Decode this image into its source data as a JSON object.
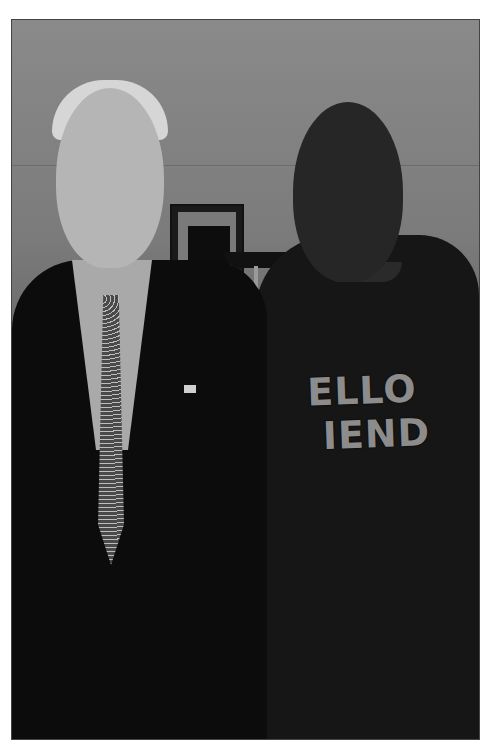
{
  "image": {
    "description": "Black-and-white photograph of two smiling men standing side by side indoors",
    "style": "black and white",
    "border_color": "#ffffff"
  },
  "background": {
    "wall": "plain gray wall",
    "objects": [
      "framed picture",
      "floor lamp"
    ]
  },
  "people": [
    {
      "position": "left",
      "attire": "dark suit, light shirt, dotted tie, flag lapel pin",
      "hair": "light gray"
    },
    {
      "position": "right",
      "attire": "dark sweatshirt with text"
    }
  ],
  "shirt_text": {
    "line1": "ELLO",
    "line2": "IEND"
  }
}
